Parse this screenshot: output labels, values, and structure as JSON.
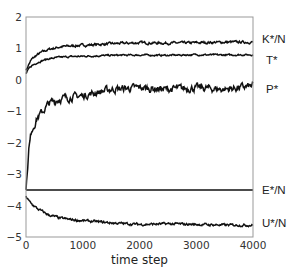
{
  "chart_data": {
    "type": "line",
    "title": "",
    "xlabel": "time step",
    "ylabel": "",
    "xlim": [
      0,
      4000
    ],
    "ylim": [
      -5,
      2
    ],
    "xticks": [
      0,
      1000,
      2000,
      3000,
      4000
    ],
    "yticks": [
      2,
      1,
      0,
      -1,
      -2,
      -3,
      -4,
      -5
    ],
    "xtick_labels": [
      "0",
      "1000",
      "2000",
      "3000",
      "4000"
    ],
    "ytick_labels": [
      "2",
      "1",
      "0",
      "−1",
      "−2",
      "−3",
      "−4",
      "−5"
    ],
    "grid": false,
    "legend_position": "right-inline-labels",
    "x": [
      0,
      50,
      100,
      200,
      300,
      400,
      600,
      800,
      1000,
      1500,
      2000,
      2500,
      3000,
      3500,
      4000
    ],
    "series": [
      {
        "name": "K*/N",
        "label": "K*/N",
        "values": [
          0.3,
          0.5,
          0.65,
          0.8,
          0.9,
          0.97,
          1.05,
          1.08,
          1.1,
          1.15,
          1.18,
          1.17,
          1.18,
          1.2,
          1.2
        ]
      },
      {
        "name": "T*",
        "label": "T*",
        "values": [
          0.2,
          0.35,
          0.45,
          0.55,
          0.62,
          0.67,
          0.72,
          0.74,
          0.75,
          0.78,
          0.79,
          0.78,
          0.8,
          0.79,
          0.8
        ]
      },
      {
        "name": "P*",
        "label": "P*",
        "values": [
          -3.5,
          -2.2,
          -1.6,
          -1.2,
          -1.0,
          -0.75,
          -0.6,
          -0.55,
          -0.5,
          -0.3,
          -0.25,
          -0.3,
          -0.25,
          -0.3,
          -0.2
        ]
      },
      {
        "name": "E*/N",
        "label": "E*/N",
        "values": [
          -3.5,
          -3.5,
          -3.5,
          -3.5,
          -3.5,
          -3.5,
          -3.5,
          -3.5,
          -3.5,
          -3.5,
          -3.5,
          -3.5,
          -3.5,
          -3.5,
          -3.5
        ]
      },
      {
        "name": "U*/N",
        "label": "U*/N",
        "values": [
          -3.7,
          -3.85,
          -3.95,
          -4.1,
          -4.2,
          -4.3,
          -4.4,
          -4.45,
          -4.48,
          -4.55,
          -4.6,
          -4.58,
          -4.6,
          -4.62,
          -4.62
        ]
      }
    ],
    "series_label_y": [
      1.2,
      0.8,
      -0.2,
      -3.5,
      -4.62
    ]
  },
  "colors": {
    "line": "#111111",
    "axis": "#999999"
  }
}
